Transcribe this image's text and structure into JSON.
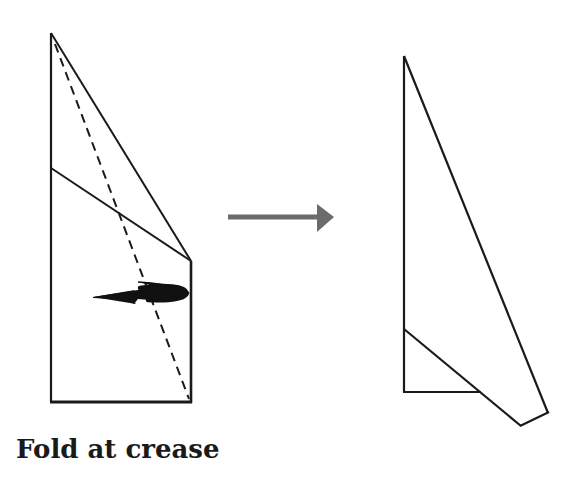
{
  "diagram": {
    "type": "origami-fold-step",
    "caption": "Fold at crease",
    "colors": {
      "line": "#1a1a1a",
      "transition_arrow": "#6b6b6b",
      "background": "#ffffff"
    },
    "before_figure": {
      "description": "Paper shape before fold, with dashed crease line and curved fold-direction arrow",
      "outline": [
        [
          51,
          33
        ],
        [
          51,
          402
        ],
        [
          191,
          402
        ],
        [
          191,
          261
        ]
      ],
      "top_diagonal": [
        [
          51,
          33
        ],
        [
          191,
          261
        ]
      ],
      "inner_fold_line": [
        [
          51,
          168
        ],
        [
          191,
          261
        ]
      ],
      "crease_dashed": [
        [
          51,
          33
        ],
        [
          191,
          402
        ]
      ],
      "fold_arrow": "curved arrow pointing left"
    },
    "transition_arrow": {
      "from": [
        228,
        217
      ],
      "to": [
        334,
        217
      ],
      "direction": "right"
    },
    "after_figure": {
      "description": "Paper shape after fold",
      "outline": [
        [
          404,
          56
        ],
        [
          404,
          392
        ],
        [
          480,
          392
        ]
      ],
      "fold_edge": [
        [
          404,
          329
        ],
        [
          521,
          426
        ]
      ],
      "bottom_edge": [
        [
          521,
          426
        ],
        [
          548,
          413
        ]
      ],
      "right_edge": [
        [
          548,
          413
        ],
        [
          404,
          56
        ]
      ]
    }
  }
}
